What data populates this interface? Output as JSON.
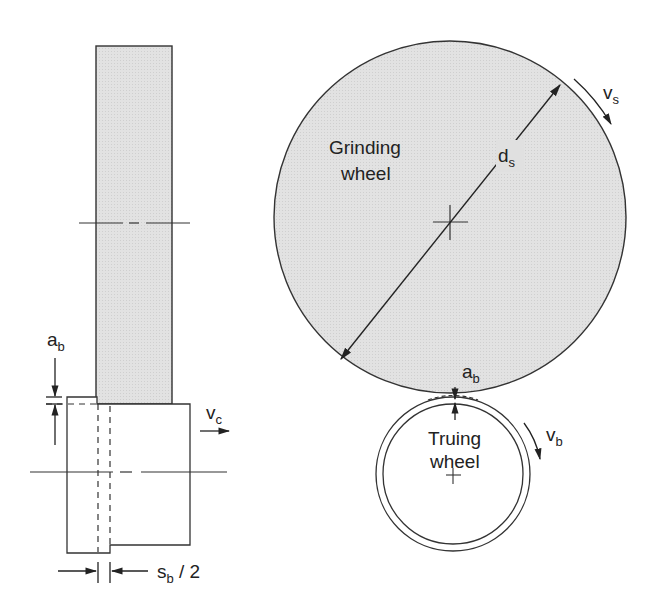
{
  "colors": {
    "wheel_fill": "#dedede",
    "stroke": "#333333",
    "background": "#ffffff"
  },
  "side_view": {
    "dimension_ab": {
      "main": "a",
      "sub": "b"
    },
    "velocity_vc": {
      "main": "v",
      "sub": "c"
    },
    "dimension_sb2": {
      "main": "s",
      "sub": "b",
      "suffix": " / 2"
    }
  },
  "front_view": {
    "grinding_wheel_label": [
      "Grinding",
      "wheel"
    ],
    "diameter_ds": {
      "main": "d",
      "sub": "s"
    },
    "velocity_vs": {
      "main": "v",
      "sub": "s"
    },
    "infeed_ab": {
      "main": "a",
      "sub": "b"
    },
    "truing_wheel_label": [
      "Truing",
      "wheel"
    ],
    "velocity_vb": {
      "main": "v",
      "sub": "b"
    }
  }
}
